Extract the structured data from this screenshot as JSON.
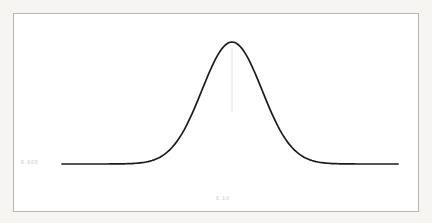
{
  "canvas": {
    "width": 432,
    "height": 223,
    "outer_bg": "#f6f5f2"
  },
  "frame": {
    "left": 13,
    "top": 13,
    "width": 406,
    "height": 199,
    "border_color": "#b7b6b4",
    "fill": "#ffffff"
  },
  "labels": {
    "y_axis_tick": "0.000",
    "x_axis_tick": "0.10",
    "label_color": "#c7c4c0"
  },
  "chart_data": {
    "type": "line",
    "title": "",
    "xlabel": "",
    "ylabel": "",
    "grid": false,
    "legend": null,
    "series": [
      {
        "name": "normal-distribution-curve",
        "shape": "gaussian",
        "color": "#1c1c1c",
        "stroke_width": 1.7,
        "mean": 0,
        "sigma": 1,
        "peak_value": 1,
        "x": [
          -5.7,
          -5,
          -4.5,
          -4,
          -3.5,
          -3,
          -2.5,
          -2,
          -1.5,
          -1,
          -0.5,
          0,
          0.5,
          1,
          1.5,
          2,
          2.5,
          3,
          3.5,
          4,
          4.5,
          5,
          5.5
        ],
        "y": [
          0,
          0,
          4e-05,
          0.0003,
          0.0022,
          0.0111,
          0.0439,
          0.1353,
          0.3247,
          0.6065,
          0.8825,
          1,
          0.8825,
          0.6065,
          0.3247,
          0.1353,
          0.0439,
          0.0111,
          0.0022,
          0.0003,
          4e-05,
          0,
          0
        ]
      }
    ],
    "pixel_mapping": {
      "x_start_px": 62,
      "x_end_px": 398,
      "mean_x_px": 232,
      "sigma_px": 30,
      "baseline_y_px": 164,
      "peak_y_px": 42
    }
  },
  "annotations": {
    "mean_line": {
      "x_px": 232,
      "from_y_px": 48,
      "to_y_px": 112,
      "color": "#e4e4e4",
      "width": 1
    }
  }
}
